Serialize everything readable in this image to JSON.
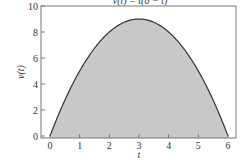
{
  "chart_data": {
    "type": "area",
    "title": "v(t) = t(6 − t)",
    "xlabel": "t",
    "ylabel": "v(t)",
    "xlim": [
      -0.5,
      6.5
    ],
    "ylim": [
      0,
      10
    ],
    "x_ticks": [
      "0",
      "1",
      "2",
      "3",
      "4",
      "5",
      "6"
    ],
    "y_ticks": [
      "0",
      "2",
      "4",
      "6",
      "8",
      "10"
    ],
    "grid": false,
    "legend": null,
    "x": [
      0,
      0.5,
      1,
      1.5,
      2,
      2.5,
      3,
      3.5,
      4,
      4.5,
      5,
      5.5,
      6
    ],
    "values": [
      0,
      2.75,
      5,
      6.75,
      8,
      8.75,
      9,
      8.75,
      8,
      6.75,
      5,
      2.75,
      0
    ],
    "fill_color": "#c8c8c8",
    "line_color": "#333333"
  }
}
